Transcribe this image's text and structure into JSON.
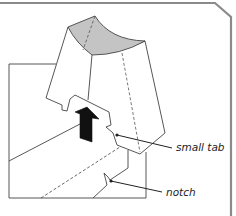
{
  "diagram": {
    "title": "",
    "labels": {
      "small_tab": "small tab",
      "notch": "notch"
    },
    "colors": {
      "frame": "#8a8a8a",
      "line": "#333333",
      "shade": "#c4c4c4",
      "arrow": "#111111"
    }
  }
}
